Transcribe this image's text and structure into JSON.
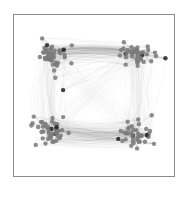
{
  "figure": {
    "type": "network-graph",
    "frame_color": "#8a8a8a",
    "background": "#ffffff",
    "node_color": "#7a7a7a",
    "node_dark_color": "#222222",
    "edge_color": "#6a6a6a",
    "clusters": [
      {
        "name": "top-left",
        "cx": 52,
        "cy": 55,
        "node_count": 45
      },
      {
        "name": "top-right",
        "cx": 136,
        "cy": 55,
        "node_count": 40
      },
      {
        "name": "bottom-left",
        "cx": 52,
        "cy": 132,
        "node_count": 45
      },
      {
        "name": "bottom-right",
        "cx": 136,
        "cy": 135,
        "node_count": 40
      }
    ],
    "bundles": [
      {
        "from": "top-left",
        "to": "top-right",
        "density": "heavy"
      },
      {
        "from": "bottom-left",
        "to": "bottom-right",
        "density": "heavy"
      },
      {
        "from": "top-left",
        "to": "bottom-left",
        "density": "light"
      },
      {
        "from": "top-right",
        "to": "bottom-right",
        "density": "light"
      },
      {
        "from": "top-left",
        "to": "bottom-right",
        "density": "faint"
      },
      {
        "from": "top-right",
        "to": "bottom-left",
        "density": "faint"
      }
    ]
  }
}
